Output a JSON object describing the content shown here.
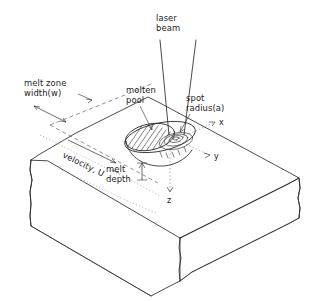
{
  "figure": {
    "background_color": "#ffffff",
    "ink_color": "#2b2b2b"
  },
  "labels": {
    "laser_beam": "laser\nbeam",
    "laser_beam_line1": "laser",
    "laser_beam_line2": "beam",
    "melt_zone_width_line1": "melt zone",
    "melt_zone_width_line2": "width(w)",
    "molten_pool_line1": "molten",
    "molten_pool_line2": "pool",
    "spot_radius_line1": "spot",
    "spot_radius_line2": "radius(a)",
    "velocity": "velocity, U",
    "melt_depth_line1": "melt",
    "melt_depth_line2": "depth"
  },
  "axes": {
    "x": "x",
    "y": "y",
    "z": "z"
  },
  "symbols": {
    "melt_zone_width": "w",
    "spot_radius": "a",
    "velocity": "U"
  },
  "annotations": [
    {
      "name": "laser-beam",
      "text": "laser beam",
      "kind": "leader-label"
    },
    {
      "name": "melt-zone-width",
      "text": "melt zone width(w)",
      "kind": "dimension-label"
    },
    {
      "name": "molten-pool",
      "text": "molten pool",
      "kind": "leader-label"
    },
    {
      "name": "spot-radius",
      "text": "spot radius(a)",
      "kind": "leader-label"
    },
    {
      "name": "velocity",
      "text": "velocity, U",
      "kind": "direction-arrow-label"
    },
    {
      "name": "melt-depth",
      "text": "melt depth",
      "kind": "dimension-label"
    }
  ]
}
